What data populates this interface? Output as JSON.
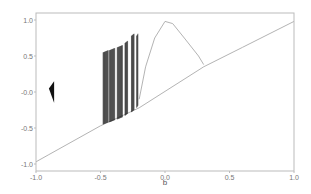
{
  "chart_data": {
    "type": "scatter",
    "title": "",
    "xlabel": "b",
    "ylabel": "",
    "xlim": [
      -1.0,
      1.0
    ],
    "ylim": [
      -1.05,
      1.1
    ],
    "grid": false,
    "legend": null,
    "x_ticks": [
      "-1.0",
      "-0.5",
      "0.0",
      "0.5",
      "1.0"
    ],
    "y_ticks": [
      "1.0",
      "0.5",
      "-0.0",
      "-0.5",
      "-1.0"
    ],
    "colors": {
      "line": "#aaaaaa",
      "bands": "#111111",
      "axis": "#bbbbbb",
      "text": "#777777"
    },
    "series": [
      {
        "name": "fixed-point-branch",
        "points": [
          [
            -1.0,
            -0.97
          ],
          [
            -0.9,
            -0.87
          ],
          [
            -0.5,
            -0.47
          ],
          [
            -0.2,
            -0.22
          ],
          [
            0.3,
            0.35
          ],
          [
            0.6,
            0.62
          ],
          [
            1.0,
            0.98
          ]
        ]
      },
      {
        "name": "upper-hump-branch",
        "points": [
          [
            -0.2,
            -0.1
          ],
          [
            -0.15,
            0.35
          ],
          [
            -0.08,
            0.75
          ],
          [
            0.0,
            0.98
          ],
          [
            0.06,
            0.95
          ],
          [
            0.15,
            0.75
          ],
          [
            0.26,
            0.5
          ],
          [
            0.3,
            0.38
          ]
        ]
      },
      {
        "name": "chaotic-bands",
        "bands": [
          {
            "b_start": -0.48,
            "b_end": -0.44,
            "y_low": -0.45,
            "y_high": 0.55
          },
          {
            "b_start": -0.43,
            "b_end": -0.39,
            "y_low": -0.42,
            "y_high": 0.58
          },
          {
            "b_start": -0.37,
            "b_end": -0.33,
            "y_low": -0.38,
            "y_high": 0.62
          },
          {
            "b_start": -0.31,
            "b_end": -0.29,
            "y_low": -0.33,
            "y_high": 0.68
          },
          {
            "b_start": -0.26,
            "b_end": -0.24,
            "y_low": -0.28,
            "y_high": 0.78
          },
          {
            "b_start": -0.22,
            "b_end": -0.21,
            "y_low": -0.22,
            "y_high": 0.78
          }
        ]
      },
      {
        "name": "isolated-attractor",
        "triangle": [
          [
            -0.9,
            0.05
          ],
          [
            -0.86,
            0.15
          ],
          [
            -0.86,
            -0.15
          ]
        ]
      }
    ]
  }
}
